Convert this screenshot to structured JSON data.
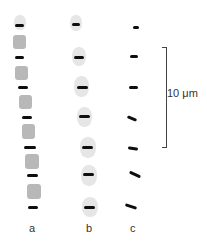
{
  "figure": {
    "columns": [
      {
        "label": "a",
        "band_count": 7,
        "description": "bands separated by gray blocks"
      },
      {
        "label": "b",
        "band_count": 7,
        "description": "bands with pale halos"
      },
      {
        "label": "c",
        "band_count": 7,
        "description": "bare bands, some tilted"
      }
    ],
    "scale_bar": {
      "label": "10 μm"
    },
    "colors": {
      "band": "#0e0e0e",
      "block": "#ababab",
      "halo": "#e6e6e6",
      "text": "#333333"
    }
  }
}
